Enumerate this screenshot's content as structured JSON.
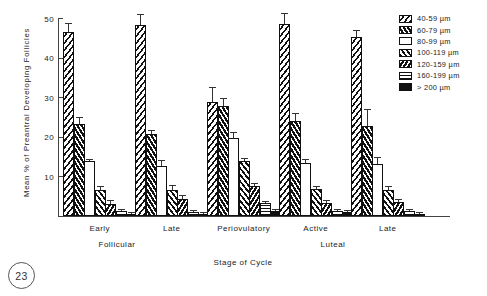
{
  "figure": {
    "number_label": "23"
  },
  "chart_data": {
    "type": "bar",
    "title": "",
    "xlabel": "Stage of Cycle",
    "ylabel": "Mean % of Preantral Developing Follicles",
    "ylim": [
      0,
      50
    ],
    "yticks": [
      10,
      20,
      30,
      40,
      50
    ],
    "grid": false,
    "legend_position": "top-right",
    "categories": [
      "Early",
      "Late",
      "Periovulatory",
      "Active",
      "Late"
    ],
    "category_groups": [
      {
        "label": "Follicular",
        "categories": [
          "Early",
          "Late"
        ]
      },
      {
        "label": "",
        "categories": [
          "Periovulatory"
        ]
      },
      {
        "label": "Luteal",
        "categories": [
          "Active",
          "Late"
        ]
      }
    ],
    "series": [
      {
        "name": "40-59 µm",
        "pattern": "diagonal-hatch-right",
        "values": [
          46.5,
          48.3,
          28.7,
          48.5,
          45.2
        ],
        "errors": [
          2.2,
          2.6,
          4.0,
          2.8,
          1.9
        ]
      },
      {
        "name": "60-79 µm",
        "pattern": "chevron-dark",
        "values": [
          23.3,
          20.7,
          27.8,
          24.1,
          22.8
        ],
        "errors": [
          1.8,
          0.9,
          2.1,
          2.0,
          4.2
        ]
      },
      {
        "name": "80-99 µm",
        "pattern": "solid-white",
        "values": [
          13.8,
          12.7,
          19.7,
          13.4,
          13.1
        ],
        "errors": [
          0.4,
          1.5,
          1.5,
          0.9,
          1.9
        ]
      },
      {
        "name": "100-119 µm",
        "pattern": "diagonal-hatch-left",
        "values": [
          6.5,
          6.6,
          13.8,
          6.9,
          6.6
        ],
        "errors": [
          1.0,
          1.2,
          0.9,
          0.8,
          0.9
        ]
      },
      {
        "name": "120-159 µm",
        "pattern": "chevron-dark-left",
        "values": [
          3.1,
          4.3,
          7.5,
          3.3,
          3.5
        ],
        "errors": [
          0.9,
          0.9,
          0.9,
          0.8,
          0.9
        ]
      },
      {
        "name": "160-199 µm",
        "pattern": "horizontal-lines",
        "values": [
          1.2,
          1.0,
          3.3,
          1.2,
          1.3
        ],
        "errors": [
          0.5,
          0.4,
          0.6,
          0.5,
          0.5
        ]
      },
      {
        "name": "> 200 µm",
        "pattern": "solid-black",
        "values": [
          0.6,
          0.5,
          1.3,
          0.9,
          0.6
        ],
        "errors": [
          0.3,
          0.3,
          0.4,
          0.3,
          0.3
        ]
      }
    ]
  }
}
